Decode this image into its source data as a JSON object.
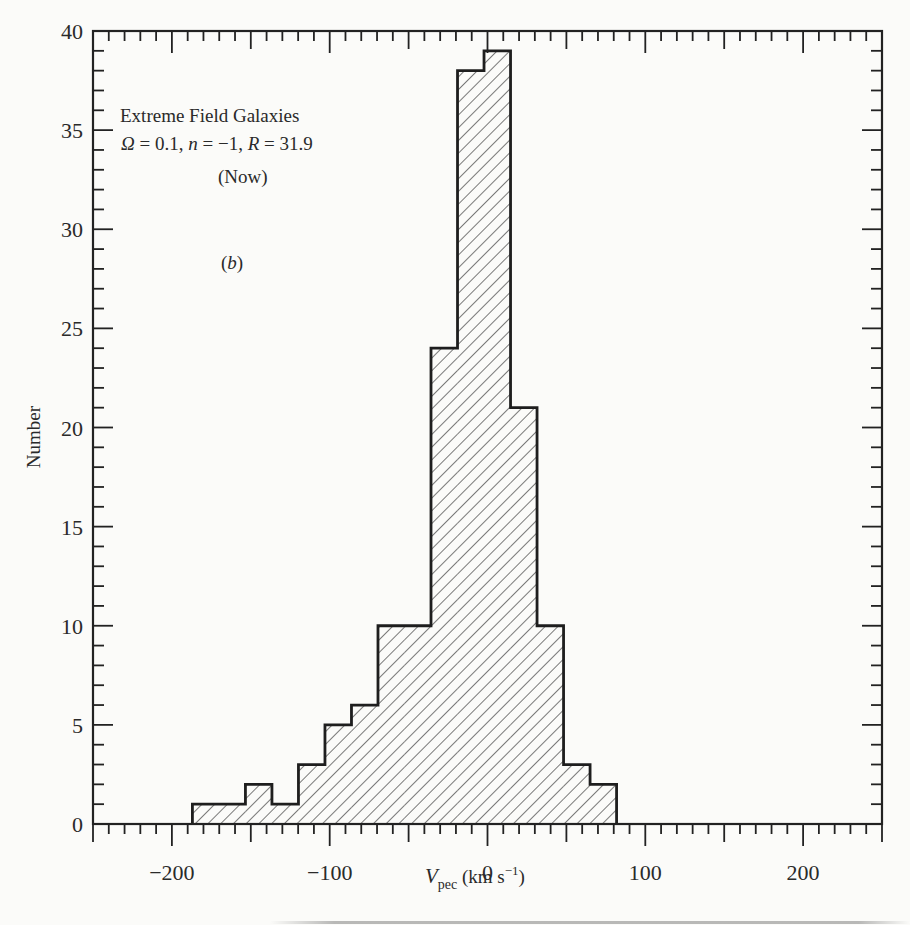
{
  "chart_data": {
    "type": "bar",
    "subtype": "histogram",
    "title": "",
    "annotations": [
      "Extreme Field Galaxies",
      "Ω = 0.1, n = −1, R = 31.9",
      "(Now)",
      "(b)"
    ],
    "xlabel": "V_pec (km s^-1)",
    "ylabel": "Number",
    "xlim": [
      -250,
      250
    ],
    "ylim": [
      0,
      40
    ],
    "x_ticks_major": [
      -200,
      -100,
      0,
      100,
      200
    ],
    "x_ticks_major_labels": [
      "−200",
      "−100",
      "0",
      "100",
      "200"
    ],
    "x_tick_major_step": 50,
    "x_tick_minor_step": 10,
    "y_ticks": [
      0,
      5,
      10,
      15,
      20,
      25,
      30,
      35,
      40
    ],
    "y_tick_labels": [
      "0",
      "5",
      "10",
      "15",
      "20",
      "25",
      "30",
      "35",
      "40"
    ],
    "y_tick_minor_step": 1,
    "grid": false,
    "legend": null,
    "fill": "diagonal hatch",
    "bin_edges": [
      -187.0,
      -170.2,
      -153.4,
      -136.6,
      -119.8,
      -103.0,
      -86.2,
      -69.4,
      -52.6,
      -35.8,
      -19.0,
      -2.2,
      14.6,
      31.4,
      48.2,
      65.0,
      81.8
    ],
    "values": [
      1,
      1,
      2,
      1,
      3,
      5,
      6,
      10,
      10,
      24,
      38,
      39,
      21,
      10,
      3,
      2
    ],
    "total_count": 176
  },
  "labels": {
    "annot_line1": "Extreme Field Galaxies",
    "annot_omega": "Ω",
    "annot_eq1": " = 0.1, ",
    "annot_n": "n",
    "annot_eq2": " = −1, ",
    "annot_R": "R",
    "annot_eq3": " = 31.9",
    "annot_now": "(Now)",
    "annot_panel_open": "(",
    "annot_panel_letter": "b",
    "annot_panel_close": ")",
    "ylabel": "Number",
    "xlabel_V": "V",
    "xlabel_sub": "pec",
    "xlabel_units_open": " (km s",
    "xlabel_sup": "−1",
    "xlabel_units_close": ")"
  },
  "colors": {
    "ink": "#222222",
    "paper": "#fbfbf9"
  }
}
